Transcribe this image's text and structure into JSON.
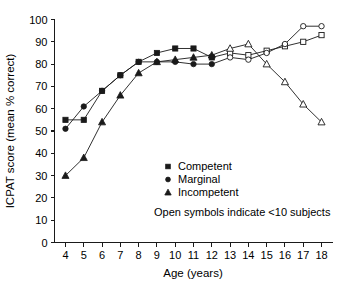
{
  "chart_data": {
    "type": "line",
    "title": "",
    "xlabel": "Age (years)",
    "ylabel": "ICPAT score (mean % correct)",
    "xlim": [
      3.4,
      18.6
    ],
    "ylim": [
      0,
      100
    ],
    "xticks": [
      4,
      5,
      6,
      7,
      8,
      9,
      10,
      11,
      12,
      13,
      14,
      15,
      16,
      17,
      18
    ],
    "yticks": [
      0,
      10,
      20,
      30,
      40,
      50,
      60,
      70,
      80,
      90,
      100
    ],
    "grid": false,
    "legend_position": "center",
    "x": [
      4,
      5,
      6,
      7,
      8,
      9,
      10,
      11,
      12,
      13,
      14,
      15,
      16,
      17,
      18
    ],
    "series": [
      {
        "name": "Competent",
        "marker": "square",
        "values": [
          55,
          55,
          68,
          75,
          81,
          85,
          87,
          87,
          83,
          85,
          84,
          86,
          88,
          90,
          93
        ],
        "open_from_index": 9
      },
      {
        "name": "Marginal",
        "marker": "circle",
        "values": [
          51,
          61,
          68,
          75,
          81,
          81,
          81,
          80,
          80,
          83,
          82,
          85,
          89,
          97,
          97
        ],
        "open_from_index": 9
      },
      {
        "name": "Incompetent",
        "marker": "triangle",
        "values": [
          30,
          38,
          54,
          66,
          76,
          81,
          82,
          83,
          84,
          87,
          89,
          80,
          72,
          62,
          54
        ],
        "open_from_index": 9
      }
    ],
    "annotation": "Open symbols indicate <10 subjects"
  },
  "legend": {
    "items": [
      {
        "label": "Competent",
        "marker": "square"
      },
      {
        "label": "Marginal",
        "marker": "circle"
      },
      {
        "label": "Incompetent",
        "marker": "triangle"
      }
    ],
    "note": "Open symbols indicate <10 subjects"
  },
  "axes": {
    "x_title": "Age (years)",
    "y_title": "ICPAT score (mean % correct)",
    "x_tick_labels": [
      "4",
      "5",
      "6",
      "7",
      "8",
      "9",
      "10",
      "11",
      "12",
      "13",
      "14",
      "15",
      "16",
      "17",
      "18"
    ],
    "y_tick_labels": [
      "0",
      "10",
      "20",
      "30",
      "40",
      "50",
      "60",
      "70",
      "80",
      "90",
      "100"
    ]
  },
  "colors": {
    "ink": "#1a1a1a",
    "background": "#ffffff"
  }
}
